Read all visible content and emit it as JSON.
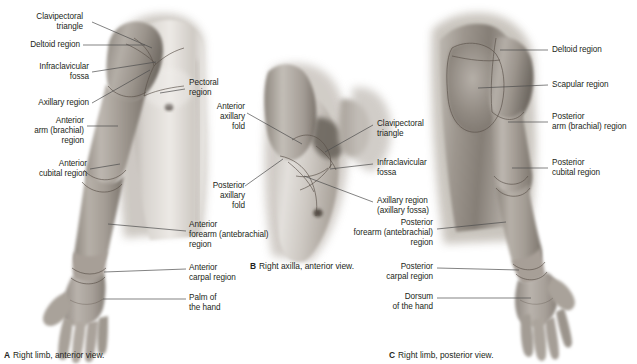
{
  "figure": {
    "background_color": "#ffffff",
    "text_color": "#231f20",
    "leader_color": "#4d4d4d"
  },
  "panels": [
    {
      "id": "A",
      "letter": "A",
      "caption": "Right limb, anterior view.",
      "labels": [
        {
          "key": "clavipectoral_triangle",
          "text": "Clavipectoral\ntriangle",
          "align": "right"
        },
        {
          "key": "deltoid_region",
          "text": "Deltoid region",
          "align": "right"
        },
        {
          "key": "infraclavicular_fossa",
          "text": "Infraclavicular\nfossa",
          "align": "right"
        },
        {
          "key": "axillary_region",
          "text": "Axillary region",
          "align": "right"
        },
        {
          "key": "anterior_arm_brachial_region",
          "text": "Anterior\narm (brachial)\nregion",
          "align": "right"
        },
        {
          "key": "anterior_cubital_region",
          "text": "Anterior\ncubital region",
          "align": "right"
        },
        {
          "key": "pectoral_region",
          "text": "Pectoral\nregion",
          "align": "left"
        },
        {
          "key": "anterior_forearm_antebrachial_region",
          "text": "Anterior\nforearm (antebrachial)\nregion",
          "align": "left"
        },
        {
          "key": "anterior_carpal_region",
          "text": "Anterior\ncarpal region",
          "align": "left"
        },
        {
          "key": "palm_of_the_hand",
          "text": "Palm of\nthe hand",
          "align": "left"
        }
      ]
    },
    {
      "id": "B",
      "letter": "B",
      "caption": "Right axilla, anterior view.",
      "labels": [
        {
          "key": "anterior_axillary_fold",
          "text": "Anterior\naxillary\nfold",
          "align": "right"
        },
        {
          "key": "posterior_axillary_fold",
          "text": "Posterior\naxillary\nfold",
          "align": "right"
        },
        {
          "key": "clavipectoral_triangle",
          "text": "Clavipectoral\ntriangle",
          "align": "left"
        },
        {
          "key": "infraclavicular_fossa",
          "text": "Infraclavicular\nfossa",
          "align": "left"
        },
        {
          "key": "axillary_region_axillary_fossa",
          "text": "Axillary region\n(axillary fossa)",
          "align": "left"
        }
      ]
    },
    {
      "id": "C",
      "letter": "C",
      "caption": "Right limb, posterior view.",
      "labels": [
        {
          "key": "deltoid_region",
          "text": "Deltoid region",
          "align": "left"
        },
        {
          "key": "scapular_region",
          "text": "Scapular region",
          "align": "left"
        },
        {
          "key": "posterior_arm_brachial_region",
          "text": "Posterior\narm (brachial) region",
          "align": "left"
        },
        {
          "key": "posterior_cubital_region",
          "text": "Posterior\ncubital region",
          "align": "left"
        },
        {
          "key": "posterior_forearm_antebrachial_region",
          "text": "Posterior\nforearm (antebrachial)\nregion",
          "align": "right"
        },
        {
          "key": "posterior_carpal_region",
          "text": "Posterior\ncarpal region",
          "align": "right"
        },
        {
          "key": "dorsum_of_the_hand",
          "text": "Dorsum\nof the hand",
          "align": "right"
        }
      ]
    }
  ]
}
